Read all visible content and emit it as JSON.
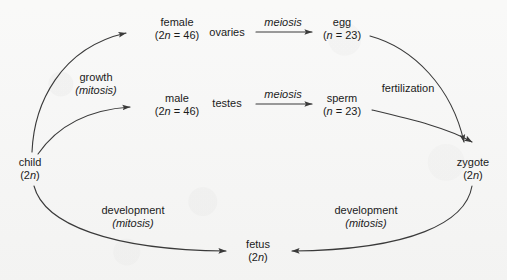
{
  "diagram": {
    "stroke_color": "#3a3a3a",
    "text_color": "#1b1b1b",
    "background_color": "#f6f6f5",
    "nodes": [
      {
        "id": "child",
        "name": "child",
        "ploidy": "(2n)",
        "x": 30,
        "y": 168
      },
      {
        "id": "female",
        "name": "female",
        "ploidy": "(2n = 46)",
        "x": 177,
        "y": 28
      },
      {
        "id": "male",
        "name": "male",
        "ploidy": "(2n = 46)",
        "x": 177,
        "y": 104
      },
      {
        "id": "egg",
        "name": "egg",
        "ploidy": "(n = 23)",
        "x": 342,
        "y": 28
      },
      {
        "id": "sperm",
        "name": "sperm",
        "ploidy": "(n = 23)",
        "x": 342,
        "y": 104
      },
      {
        "id": "zygote",
        "name": "zygote",
        "ploidy": "(2n)",
        "x": 473,
        "y": 168
      },
      {
        "id": "fetus",
        "name": "fetus",
        "ploidy": "(2n)",
        "x": 258,
        "y": 250
      }
    ],
    "edge_labels": [
      {
        "id": "growth",
        "line1": "growth",
        "line2": "(mitosis)",
        "line1_italic": false,
        "line2_italic": true,
        "x": 96,
        "y": 83
      },
      {
        "id": "ovaries",
        "line1": "ovaries",
        "line2": "",
        "line1_italic": false,
        "line2_italic": false,
        "x": 227,
        "y": 32
      },
      {
        "id": "testes",
        "line1": "testes",
        "line2": "",
        "line1_italic": false,
        "line2_italic": false,
        "x": 227,
        "y": 103
      },
      {
        "id": "meiosis-egg",
        "line1": "meiosis",
        "line2": "",
        "line1_italic": true,
        "line2_italic": false,
        "x": 283,
        "y": 22
      },
      {
        "id": "meiosis-sperm",
        "line1": "meiosis",
        "line2": "",
        "line1_italic": true,
        "line2_italic": false,
        "x": 283,
        "y": 94
      },
      {
        "id": "fertilization",
        "line1": "fertilization",
        "line2": "",
        "line1_italic": false,
        "line2_italic": false,
        "x": 408,
        "y": 88
      },
      {
        "id": "development-left",
        "line1": "development",
        "line2": "(mitosis)",
        "line1_italic": false,
        "line2_italic": true,
        "x": 133,
        "y": 216
      },
      {
        "id": "development-right",
        "line1": "development",
        "line2": "(mitosis)",
        "line1_italic": false,
        "line2_italic": true,
        "x": 366,
        "y": 216
      }
    ],
    "edges": [
      {
        "id": "child-to-female",
        "from": "child",
        "to": "female",
        "style": "curved",
        "arrowhead": "to"
      },
      {
        "id": "child-to-male",
        "from": "child",
        "to": "male",
        "style": "curved",
        "arrowhead": "to"
      },
      {
        "id": "ovaries-to-egg",
        "from": "female",
        "to": "egg",
        "style": "straight",
        "arrowhead": "to"
      },
      {
        "id": "testes-to-sperm",
        "from": "male",
        "to": "sperm",
        "style": "straight",
        "arrowhead": "to"
      },
      {
        "id": "egg-to-zygote",
        "from": "egg",
        "to": "zygote",
        "style": "curved",
        "arrowhead": "to"
      },
      {
        "id": "sperm-to-zygote",
        "from": "sperm",
        "to": "zygote",
        "style": "curved",
        "arrowhead": "to"
      },
      {
        "id": "zygote-to-fetus",
        "from": "zygote",
        "to": "fetus",
        "style": "curved",
        "arrowhead": "to"
      },
      {
        "id": "child-to-fetus",
        "from": "child",
        "to": "fetus",
        "style": "curved",
        "arrowhead": "to"
      }
    ]
  }
}
